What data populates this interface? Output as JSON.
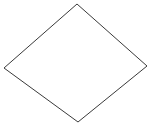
{
  "canvas": {
    "width": 153,
    "height": 123,
    "background_color": "#ffffff",
    "label": "diamond-outline-diagram"
  },
  "shapes": [
    {
      "id": "diamond",
      "name": "diamond",
      "type": "polygon",
      "stroke_color": "#3a3a3a",
      "fill_color": "#ffffff",
      "stroke_width": 1,
      "vertices": [
        {
          "name": "top",
          "x": 77,
          "y": 4
        },
        {
          "name": "right",
          "x": 147,
          "y": 66
        },
        {
          "name": "bottom",
          "x": 78,
          "y": 122
        },
        {
          "name": "left",
          "x": 4,
          "y": 68
        }
      ],
      "points": "77,4 147,66 78,122 4,68"
    }
  ],
  "labels": [],
  "annotations": []
}
